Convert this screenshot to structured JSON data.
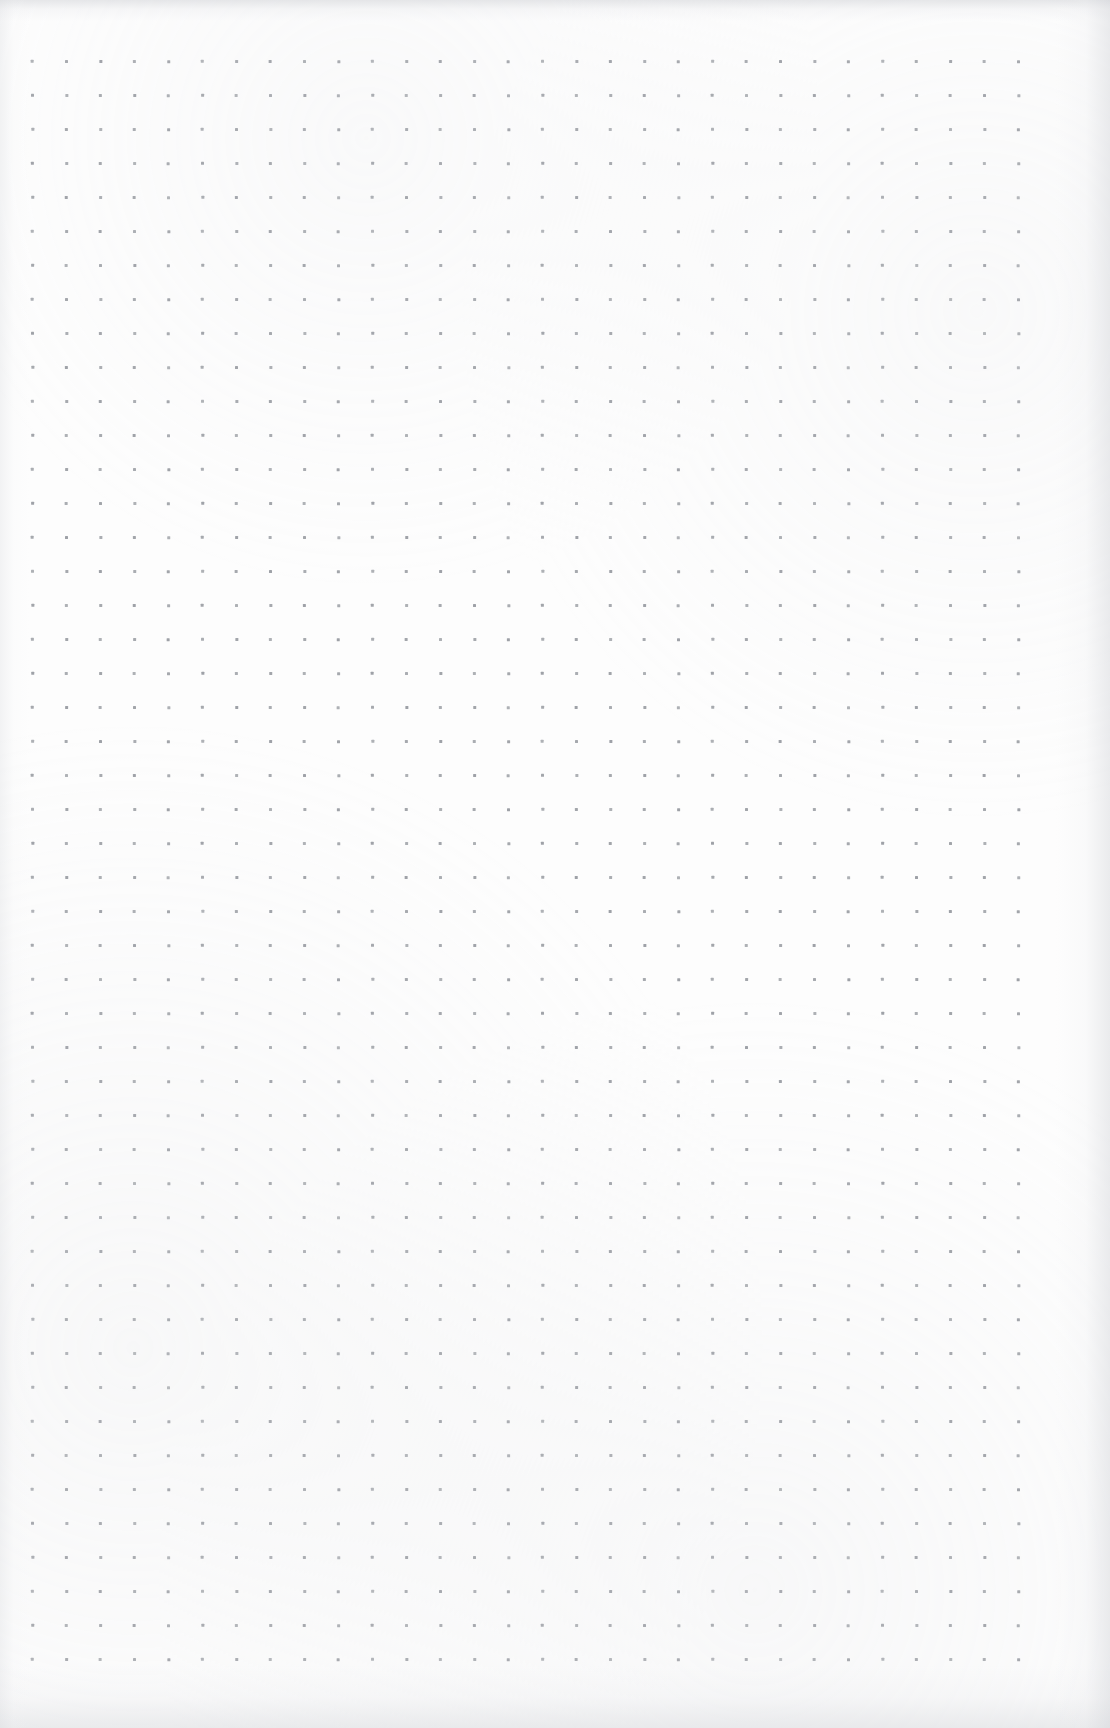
{
  "page": {
    "kind": "dot-grid-paper-scan",
    "width_px": 1110,
    "height_px": 1728,
    "background_color": "#fdfdfd",
    "visible_text": "",
    "annotations": [],
    "notes_written": "none"
  },
  "grid": {
    "dot_color": "#9a9da3",
    "dot_size_px": 3,
    "dot_shape": "square",
    "spacing_px": 34,
    "origin_x_px": 31,
    "origin_y_px": 60,
    "columns": 30,
    "rows": 48,
    "last_column_x_px": 1017,
    "last_row_y_px": 1658
  },
  "scan_artifacts": {
    "top_edge_shadow_color": "#c6c8cd",
    "bottom_edge_shadow_color": "#d0d2d6",
    "left_edge_shadow_color": "#d8dade",
    "right_edge_shadow_color": "#ced0d5"
  }
}
